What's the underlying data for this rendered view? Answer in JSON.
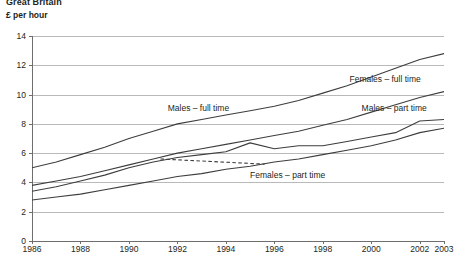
{
  "header": {
    "region": "Great Britain",
    "unit": "£ per hour"
  },
  "chart_data": {
    "type": "line",
    "title": "Great Britain",
    "subtitle": "£ per hour",
    "xlabel": "",
    "ylabel": "£ per hour",
    "xlim": [
      1986,
      2003
    ],
    "ylim": [
      0,
      14
    ],
    "yticks": [
      0,
      2,
      4,
      6,
      8,
      10,
      12,
      14
    ],
    "xticks": [
      1986,
      1988,
      1990,
      1992,
      1994,
      1996,
      1998,
      2000,
      2002,
      2003
    ],
    "xtick_labels": [
      "1986",
      "1988",
      "1990",
      "1992",
      "1994",
      "1996",
      "1998",
      "2000",
      "2002",
      "2003"
    ],
    "grid": true,
    "legend": "inline-labels",
    "x": [
      1986,
      1987,
      1988,
      1989,
      1990,
      1991,
      1992,
      1993,
      1994,
      1995,
      1996,
      1997,
      1998,
      1999,
      2000,
      2001,
      2002,
      2003
    ],
    "series": [
      {
        "name": "Males – full time",
        "label": "Males – full time",
        "style": "solid",
        "values": [
          5.0,
          5.4,
          5.9,
          6.4,
          7.0,
          7.5,
          8.0,
          8.3,
          8.6,
          8.9,
          9.2,
          9.6,
          10.1,
          10.6,
          11.2,
          11.8,
          12.4,
          12.8
        ]
      },
      {
        "name": "Females – full time",
        "label": "Females – full time",
        "style": "solid",
        "values": [
          3.8,
          4.1,
          4.4,
          4.8,
          5.2,
          5.6,
          6.0,
          6.3,
          6.6,
          6.9,
          7.2,
          7.5,
          7.9,
          8.3,
          8.8,
          9.3,
          9.8,
          10.2
        ]
      },
      {
        "name": "Males – part time",
        "label": "Males – part time",
        "style": "solid",
        "values": [
          3.4,
          3.7,
          4.1,
          4.5,
          5.0,
          5.4,
          5.7,
          5.9,
          6.1,
          6.7,
          6.3,
          6.5,
          6.5,
          6.8,
          7.1,
          7.4,
          8.2,
          8.3
        ]
      },
      {
        "name": "Females – part time",
        "label": "Females – part time",
        "style": "solid",
        "values": [
          2.8,
          3.0,
          3.2,
          3.5,
          3.8,
          4.1,
          4.4,
          4.6,
          4.9,
          5.1,
          5.4,
          5.6,
          5.9,
          6.2,
          6.5,
          6.9,
          7.4,
          7.7
        ]
      }
    ],
    "annotations": [
      {
        "text": "Males – full time",
        "x": 1991.6,
        "y": 9.05
      },
      {
        "text": "Females – full time",
        "x": 1999.1,
        "y": 11.05
      },
      {
        "text": "Males – part time",
        "x": 1999.6,
        "y": 9.1
      },
      {
        "text": "Females – part time",
        "x": 1995.0,
        "y": 4.5
      }
    ],
    "leader_lines": [
      {
        "from_label": "Females – part time",
        "style": "dashed",
        "x0": 1991.3,
        "y0": 5.6,
        "x1": 1995.6,
        "y1": 5.25
      }
    ]
  }
}
